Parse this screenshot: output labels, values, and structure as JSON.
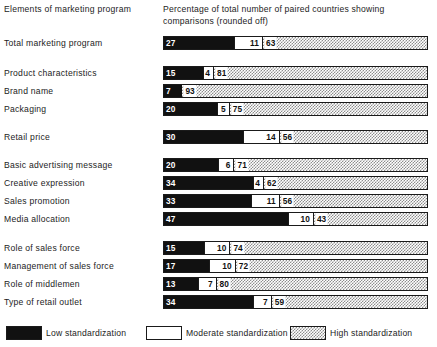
{
  "header": {
    "left_title": "Elements of marketing program",
    "right_title": "Percentage of total number of paired countries showing comparisons (rounded off)"
  },
  "legend": {
    "items": [
      {
        "key": "low",
        "label": "Low standardization",
        "color": "#111111",
        "pattern": "solid-black"
      },
      {
        "key": "mod",
        "label": "Moderate standardization",
        "color": "#ffffff",
        "pattern": "solid-white"
      },
      {
        "key": "high",
        "label": "High standardization",
        "color": "#8d8d8d",
        "pattern": "checker-dots"
      }
    ]
  },
  "chart_data": {
    "type": "bar",
    "orientation": "horizontal",
    "stacked": true,
    "title": "",
    "xlabel": "Percentage of total number of paired countries showing comparisons (rounded off)",
    "ylabel": "Elements of marketing program",
    "xlim": [
      0,
      100
    ],
    "grid": false,
    "legend_position": "bottom",
    "series": [
      {
        "name": "Low standardization",
        "values": [
          27,
          15,
          7,
          20,
          30,
          20,
          34,
          33,
          47,
          15,
          17,
          13,
          34
        ]
      },
      {
        "name": "Moderate standardization",
        "values": [
          11,
          4,
          0,
          5,
          14,
          6,
          4,
          11,
          10,
          10,
          10,
          7,
          7
        ]
      },
      {
        "name": "High standardization",
        "values": [
          63,
          81,
          93,
          75,
          56,
          71,
          62,
          56,
          43,
          74,
          72,
          80,
          59
        ]
      }
    ],
    "categories": [
      "Total marketing program",
      "Product characteristics",
      "Brand name",
      "Packaging",
      "Retail price",
      "Basic advertising message",
      "Creative expression",
      "Sales promotion",
      "Media allocation",
      "Role of sales force",
      "Management of sales force",
      "Role of middlemen",
      "Type of retail outlet"
    ]
  },
  "rows": [
    {
      "label": "Total marketing program",
      "low": 27,
      "mod": 11,
      "high": 63,
      "low_text": "27",
      "mod_text": "11",
      "high_text": "63",
      "top": 36,
      "group": 0
    },
    {
      "label": "Product characteristics",
      "low": 15,
      "mod": 4,
      "high": 81,
      "low_text": "15",
      "mod_text": "4",
      "high_text": "81",
      "top": 66,
      "group": 1
    },
    {
      "label": "Brand name",
      "low": 7,
      "mod": 0,
      "high": 93,
      "low_text": "7",
      "mod_text": "",
      "high_text": "93",
      "top": 84,
      "group": 1
    },
    {
      "label": "Packaging",
      "low": 20,
      "mod": 5,
      "high": 75,
      "low_text": "20",
      "mod_text": "5",
      "high_text": "75",
      "top": 102,
      "group": 1
    },
    {
      "label": "Retail price",
      "low": 30,
      "mod": 14,
      "high": 56,
      "low_text": "30",
      "mod_text": "14",
      "high_text": "56",
      "top": 130,
      "group": 2
    },
    {
      "label": "Basic advertising message",
      "low": 20,
      "mod": 6,
      "high": 71,
      "low_text": "20",
      "mod_text": "6",
      "high_text": "71",
      "top": 158,
      "group": 3
    },
    {
      "label": "Creative expression",
      "low": 34,
      "mod": 4,
      "high": 62,
      "low_text": "34",
      "mod_text": "4",
      "high_text": "62",
      "top": 176,
      "group": 3
    },
    {
      "label": "Sales promotion",
      "low": 33,
      "mod": 11,
      "high": 56,
      "low_text": "33",
      "mod_text": "11",
      "high_text": "56",
      "top": 194,
      "group": 3
    },
    {
      "label": "Media allocation",
      "low": 47,
      "mod": 10,
      "high": 43,
      "low_text": "47",
      "mod_text": "10",
      "high_text": "43",
      "top": 212,
      "group": 3
    },
    {
      "label": "Role of sales force",
      "low": 15,
      "mod": 10,
      "high": 74,
      "low_text": "15",
      "mod_text": "10",
      "high_text": "74",
      "top": 241,
      "group": 4
    },
    {
      "label": "Management of sales force",
      "low": 17,
      "mod": 10,
      "high": 72,
      "low_text": "17",
      "mod_text": "10",
      "high_text": "72",
      "top": 259,
      "group": 4
    },
    {
      "label": "Role of middlemen",
      "low": 13,
      "mod": 7,
      "high": 80,
      "low_text": "13",
      "mod_text": "7",
      "high_text": "80",
      "top": 277,
      "group": 4
    },
    {
      "label": "Type of retail outlet",
      "low": 34,
      "mod": 7,
      "high": 59,
      "low_text": "34",
      "mod_text": "7",
      "high_text": "59",
      "top": 295,
      "group": 4
    }
  ]
}
